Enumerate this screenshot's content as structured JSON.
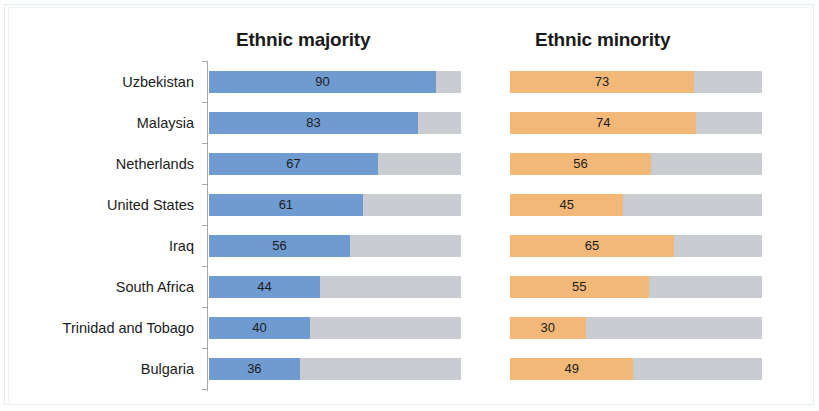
{
  "chart_data": {
    "type": "bar",
    "orientation": "horizontal",
    "layout": "two-panel-stacked-to-100",
    "title": "",
    "xlabel": "",
    "ylabel": "",
    "xlim": [
      0,
      100
    ],
    "grid": false,
    "legend": "none",
    "track_color": "#c9cdd2",
    "categories": [
      "Uzbekistan",
      "Malaysia",
      "Netherlands",
      "United States",
      "Iraq",
      "South Africa",
      "Trinidad and Tobago",
      "Bulgaria"
    ],
    "panels": [
      {
        "title": "Ethnic majority",
        "color": "#6f9bd1",
        "values": [
          90,
          83,
          67,
          61,
          56,
          44,
          40,
          36
        ]
      },
      {
        "title": "Ethnic minority",
        "color": "#f2b878",
        "values": [
          73,
          74,
          56,
          45,
          65,
          55,
          30,
          49
        ]
      }
    ],
    "series": [
      {
        "name": "Ethnic majority",
        "color": "#6f9bd1",
        "values": [
          90,
          83,
          67,
          61,
          56,
          44,
          40,
          36
        ]
      },
      {
        "name": "Ethnic minority",
        "color": "#f2b878",
        "values": [
          73,
          74,
          56,
          45,
          65,
          55,
          30,
          49
        ]
      }
    ]
  }
}
